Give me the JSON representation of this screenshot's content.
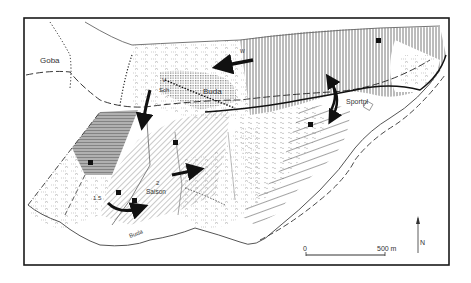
{
  "map": {
    "labels": {
      "goba": "Goba",
      "buda_village": "Buda",
      "v": "V",
      "sch": "Sch",
      "sportpl": "Sportpl",
      "saison": "Saison",
      "saison_num": "2",
      "zone_num": "1.5",
      "w": "W",
      "river_buda": "Buda"
    },
    "scale_bar": {
      "start": "0",
      "end": "500 m"
    },
    "north_arrow": {
      "label": "N"
    },
    "colors": {
      "frame": "#1a1a1a",
      "ink": "#222222",
      "gray_zone": "#9a9a9a",
      "hatch": "#555555",
      "background": "#ffffff"
    }
  }
}
